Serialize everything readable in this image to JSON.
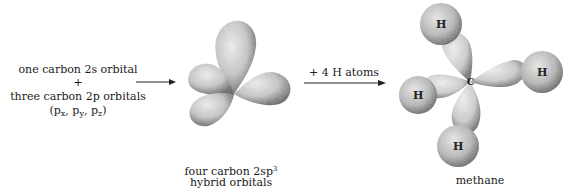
{
  "reactants": {
    "line1": "one carbon 2s orbital",
    "plus": "+",
    "line2": "three carbon 2p orbitals",
    "p_open": "(p",
    "px_sub": "x",
    "py": ", p",
    "py_sub": "y",
    "pz": ", p",
    "pz_sub": "z",
    "p_close": ")"
  },
  "hybrid": {
    "caption_line1": "four carbon 2sp",
    "caption_sup": "3",
    "caption_line2": "hybrid orbitals"
  },
  "reaction_step": {
    "label": "+ 4 H atoms"
  },
  "methane": {
    "center_label": "C",
    "hydrogen_labels": [
      "H",
      "H",
      "H",
      "H"
    ],
    "caption": "methane"
  }
}
